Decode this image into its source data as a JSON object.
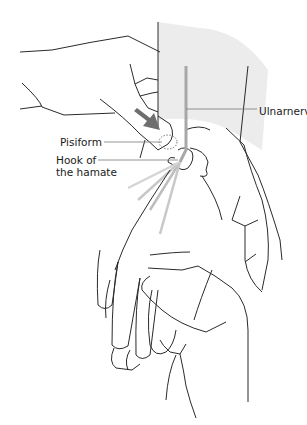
{
  "figure": {
    "labels": {
      "ulnar_nerve": "Ulnarnerv",
      "pisiform": "Pisiform",
      "hook_line1": "Hook of",
      "hook_line2": "the hamate"
    },
    "colors": {
      "line": "#2a2a2a",
      "forearm_shade": "#ececec",
      "nerve": "#a8a8a8",
      "arrow": "#6e6e6e",
      "leader": "#7a7a7a"
    }
  }
}
